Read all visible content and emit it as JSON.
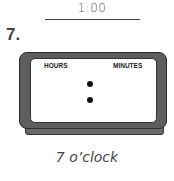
{
  "worksheet": {
    "answer_value": "1:00",
    "problem_number": "7.",
    "clock": {
      "hours_label": "HOURS",
      "minutes_label": "MINUTES",
      "separator": ":"
    },
    "caption": "7 o’clock"
  }
}
